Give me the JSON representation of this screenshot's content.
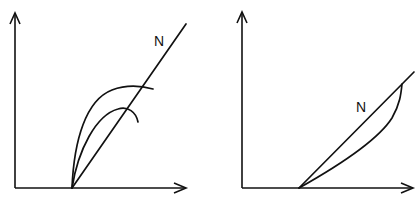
{
  "figure": {
    "panels": [
      {
        "id": "left",
        "line_label": "N",
        "description": "Straight line N from origin with two concave-down curves rising from the same point and bending over, each crossing N"
      },
      {
        "id": "right",
        "line_label": "N",
        "description": "Straight line N from origin with a concave-up curve below it forming a closed loop meeting N at the top"
      }
    ],
    "colors": {
      "ink": "#111111",
      "background": "#ffffff"
    }
  }
}
